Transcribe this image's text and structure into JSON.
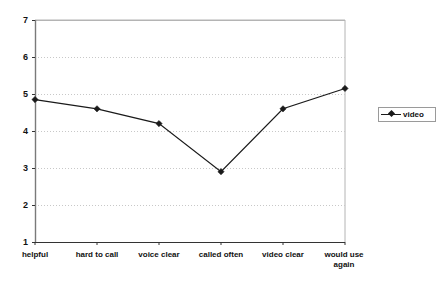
{
  "chart_data": {
    "type": "line",
    "title": "",
    "subtitle": "",
    "xlabel": "",
    "ylabel": "",
    "categories": [
      "helpful",
      "hard to call",
      "voice clear",
      "called often",
      "video clear",
      "would use again"
    ],
    "series": [
      {
        "name": "video",
        "values": [
          4.85,
          4.6,
          4.2,
          2.9,
          4.6,
          5.15
        ]
      }
    ],
    "ylim": [
      1,
      7
    ],
    "yticks": [
      1,
      2,
      3,
      4,
      5,
      6,
      7
    ],
    "ytick_labels": [
      "1",
      "2",
      "3",
      "4",
      "5",
      "6",
      "7"
    ],
    "grid": "horizontal-dotted",
    "legend_position": "right",
    "legend_entries": [
      "video"
    ],
    "marker": "diamond",
    "line_color": "#1a1a1a",
    "grid_color": "#c8c8c8",
    "axis_color": "#7a7a7a",
    "plot_border_color": "#b4b4b4",
    "background": "#ffffff"
  }
}
